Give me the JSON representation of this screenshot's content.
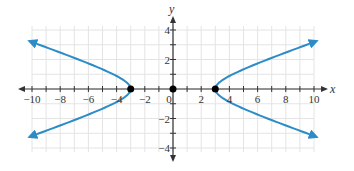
{
  "chart_data": {
    "type": "line",
    "title": "",
    "xlabel": "x",
    "ylabel": "y",
    "xlim": [
      -10,
      10
    ],
    "ylim": [
      -4,
      4
    ],
    "grid": true,
    "x_ticks": [
      -10,
      -8,
      -6,
      -4,
      -2,
      0,
      2,
      4,
      6,
      8,
      10
    ],
    "x_tick_labels": [
      "−10",
      "−8",
      "−6",
      "−4",
      "−2",
      "0",
      "2",
      "4",
      "6",
      "8",
      "10"
    ],
    "y_ticks": [
      -4,
      -2,
      2,
      4
    ],
    "y_tick_labels": [
      "−4",
      "−2",
      "2",
      "4"
    ],
    "equation": "x^2/9 - y^2 = 1",
    "series": [
      {
        "name": "left-branch",
        "points": [
          [
            -10,
            3.18
          ],
          [
            -8,
            2.47
          ],
          [
            -6,
            1.73
          ],
          [
            -4,
            0.88
          ],
          [
            -3,
            0
          ],
          [
            -4,
            -0.88
          ],
          [
            -6,
            -1.73
          ],
          [
            -8,
            -2.47
          ],
          [
            -10,
            -3.18
          ]
        ]
      },
      {
        "name": "right-branch",
        "points": [
          [
            10,
            3.18
          ],
          [
            8,
            2.47
          ],
          [
            6,
            1.73
          ],
          [
            4,
            0.88
          ],
          [
            3,
            0
          ],
          [
            4,
            -0.88
          ],
          [
            6,
            -1.73
          ],
          [
            8,
            -2.47
          ],
          [
            10,
            -3.18
          ]
        ]
      }
    ],
    "marked_points": [
      [
        -3,
        0
      ],
      [
        0,
        0
      ],
      [
        3,
        0
      ]
    ],
    "colors": {
      "curve": "#2b8cc8",
      "axis": "#333333",
      "grid": "#e4e4e4",
      "point": "#000000"
    }
  }
}
